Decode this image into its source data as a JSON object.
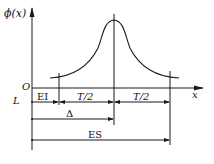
{
  "figure": {
    "y_axis_label": "ϕ(x)",
    "x_axis_label": "x",
    "origin_label": "O",
    "line_label": "L",
    "dimensions": {
      "ei": "EI",
      "half_tol_left": "T/2",
      "half_tol_right": "T/2",
      "delta": "Δ",
      "es": "ES"
    },
    "curve": "bell-shaped distribution ϕ(x) centered at Δ, spanning tolerance T from EI to ES"
  }
}
